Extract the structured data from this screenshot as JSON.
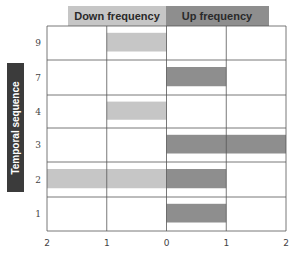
{
  "chart_data": {
    "type": "bar",
    "orientation": "horizontal-diverging",
    "title": "",
    "ylabel": "Temporal sequence",
    "xlabel": "",
    "legend": [
      {
        "name": "Down frequency",
        "color": "#c6c6c6",
        "direction": "left"
      },
      {
        "name": "Up frequency",
        "color": "#8e8e8e",
        "direction": "right"
      }
    ],
    "legend_placement": "top",
    "categories": [
      "9",
      "7",
      "4",
      "3",
      "2",
      "1"
    ],
    "series": [
      {
        "name": "Down frequency",
        "values": [
          1,
          0,
          1,
          0,
          2,
          0
        ]
      },
      {
        "name": "Up frequency",
        "values": [
          0,
          1,
          0,
          2,
          1,
          1
        ]
      }
    ],
    "xlim": [
      -2,
      2
    ],
    "x_tick_labels": [
      "2",
      "1",
      "0",
      "1",
      "2"
    ],
    "grid": true
  },
  "colors": {
    "down": "#c6c6c6",
    "up": "#8e8e8e",
    "label_box": "#3b3b3b",
    "grid": "#555555"
  }
}
